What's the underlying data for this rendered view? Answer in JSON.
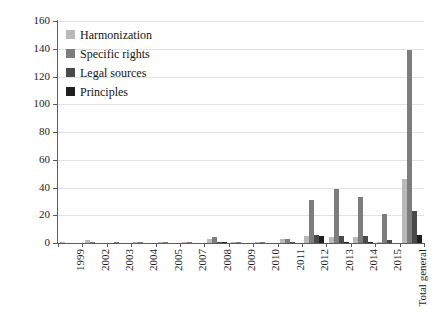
{
  "chart_data": {
    "type": "bar",
    "title": "",
    "subtitle": "",
    "xlabel": "",
    "ylabel": "",
    "ylim": [
      0,
      160
    ],
    "ytick_step": 20,
    "yticks": [
      0,
      20,
      40,
      60,
      80,
      100,
      120,
      140,
      160
    ],
    "grid": "horizontal",
    "legend_position": "top-left",
    "categories": [
      "1999",
      "2002",
      "2003",
      "2004",
      "2005",
      "2007",
      "2008",
      "2009",
      "2010",
      "2011",
      "2012",
      "2013",
      "2014",
      "2015",
      "Total general"
    ],
    "series": [
      {
        "name": "Harmonization",
        "color": "#b9b9b9",
        "values": [
          1,
          2,
          0,
          1,
          1,
          1,
          3,
          1,
          1,
          3,
          5,
          4,
          4,
          1,
          46
        ]
      },
      {
        "name": "Specific rights",
        "color": "#7d7d7d",
        "values": [
          0,
          1,
          1,
          1,
          1,
          1,
          4,
          1,
          1,
          3,
          31,
          39,
          33,
          21,
          139
        ]
      },
      {
        "name": "Legal sources",
        "color": "#4a4a4a",
        "values": [
          0,
          0,
          0,
          0,
          0,
          0,
          1,
          0,
          0,
          1,
          6,
          5,
          5,
          2,
          23
        ]
      },
      {
        "name": "Principles",
        "color": "#1f1f1f",
        "values": [
          0,
          0,
          0,
          0,
          0,
          0,
          1,
          0,
          0,
          0,
          5,
          1,
          1,
          0,
          6
        ]
      }
    ]
  }
}
